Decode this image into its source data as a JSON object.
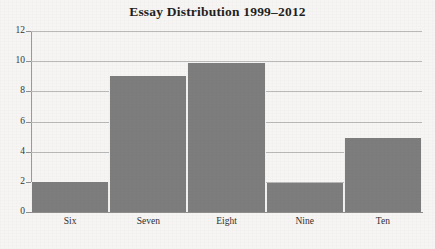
{
  "chart_data": {
    "type": "bar",
    "title": "Essay Distribution 1999–2012",
    "xlabel": "",
    "ylabel": "",
    "categories": [
      "Six",
      "Seven",
      "Eight",
      "Nine",
      "Ten"
    ],
    "values": [
      2,
      9,
      9.9,
      1.95,
      4.9
    ],
    "ylim": [
      0,
      12
    ],
    "yticks": [
      0,
      2,
      4,
      6,
      8,
      10,
      12
    ],
    "ytick_labels": [
      "0",
      "2",
      "4",
      "6",
      "8",
      "10",
      "12"
    ],
    "grid": true,
    "legend": false,
    "bar_color": "#7d7d7d",
    "grid_color": "#b9b9b9",
    "axis_color": "#8f8f8f",
    "background_color": "#f6f5f3",
    "title_color": "#1f1f1f"
  }
}
